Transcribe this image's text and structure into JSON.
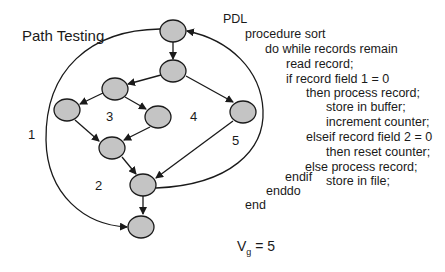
{
  "title": "Path Testing",
  "regions": [
    "1",
    "2",
    "3",
    "4",
    "5"
  ],
  "pdl": {
    "header": "PDL",
    "lines": [
      "procedure sort",
      "do while records remain",
      "read record;",
      "if record field 1 = 0",
      "then process record;",
      "store in buffer;",
      "increment counter;",
      "elseif  record field 2 = 0",
      "then reset counter;",
      "else process record;",
      "store in file;",
      "endif",
      "enddo",
      "end"
    ]
  },
  "complexity": {
    "symbol": "V",
    "subscript": "g",
    "value": "= 5"
  },
  "graph": {
    "node_fill": "#c4c4c4",
    "node_stroke": "#1a1a1a",
    "node_count": 9
  }
}
